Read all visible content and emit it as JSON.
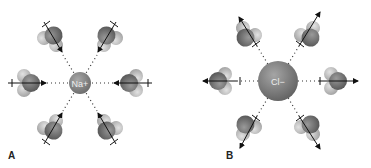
{
  "figure": {
    "panels": [
      {
        "id": "A",
        "label": "A",
        "ion": {
          "symbol": "Na",
          "charge": "+",
          "text": "Na+",
          "cx": 80,
          "cy": 83,
          "r": 11,
          "color": "#8a8a8a"
        },
        "dipole_direction": "inward",
        "water_count": 6
      },
      {
        "id": "B",
        "label": "B",
        "ion": {
          "symbol": "Cl",
          "charge": "−",
          "text": "Cl−",
          "cx": 278,
          "cy": 81,
          "r": 20,
          "color": "#8c8c8c"
        },
        "dipole_direction": "outward",
        "water_count": 6
      }
    ],
    "colors": {
      "oxygen": "#6e6e6e",
      "hydrogen": "#bdbdbd",
      "arrow": "#111111",
      "dots": "#333333"
    }
  }
}
